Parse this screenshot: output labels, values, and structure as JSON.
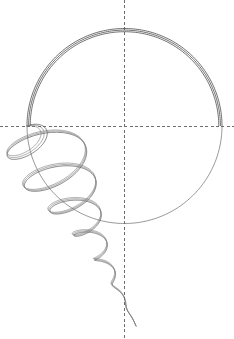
{
  "figure": {
    "width": 234,
    "height": 339,
    "background_color": "#ffffff",
    "line_color": "#555555",
    "axis_color": "#6e6e6e"
  },
  "chart_data": {
    "type": "line",
    "subtitle": "",
    "xlabel": "",
    "ylabel": "",
    "grid": false,
    "legend": "none",
    "axis_style": "dashed crosshair",
    "xlim": [
      0,
      234
    ],
    "ylim": [
      0,
      339
    ],
    "annotations": [],
    "tick_labels": {
      "x": [],
      "y": []
    },
    "center": {
      "x": 124.5,
      "y": 126
    },
    "circle": {
      "center_x": 124.5,
      "center_y": 126,
      "radius": 97.5,
      "left_point": {
        "x": 27,
        "y": 126
      },
      "right_point": {
        "x": 222,
        "y": 126
      },
      "top_point": {
        "x": 124.5,
        "y": 28.5
      },
      "bottom_point": {
        "x": 124.5,
        "y": 223.5
      },
      "overlapping_arc_count": 3,
      "arc_offsets": [
        0,
        1.6,
        3.2
      ],
      "heavy_arc_span_deg": [
        180,
        360
      ],
      "thin_arc_span_deg": [
        0,
        180
      ]
    },
    "axes": [
      {
        "name": "horizontal-axis",
        "orientation": "horizontal",
        "y": 126,
        "x_start": 0,
        "x_end": 234,
        "dash": "3 2.4"
      },
      {
        "name": "vertical-axis",
        "orientation": "vertical",
        "x": 124.5,
        "y_start": 0,
        "y_end": 339,
        "dash": "3 2.4"
      }
    ],
    "spiral": {
      "description": "damped oscillating spiral emanating from circle left point, converging to vertical axis at bottom",
      "origin": {
        "x": 27,
        "y": 126
      },
      "terminus": {
        "x": 122,
        "y": 326
      },
      "turn_count": 7,
      "decay": 0.72,
      "strand_count": 3,
      "strand_phase_offsets_deg": [
        0,
        14,
        28
      ],
      "lobe_extrema": [
        {
          "x": 30,
          "y": 132,
          "r": 4
        },
        {
          "x": 40,
          "y": 168,
          "r": 26
        },
        {
          "x": 69,
          "y": 160,
          "r": 40
        },
        {
          "x": 35,
          "y": 200,
          "r": 52
        },
        {
          "x": 98,
          "y": 190,
          "r": 62
        },
        {
          "x": 58,
          "y": 232,
          "r": 58
        },
        {
          "x": 128,
          "y": 216,
          "r": 52
        },
        {
          "x": 82,
          "y": 248,
          "r": 48
        },
        {
          "x": 150,
          "y": 236,
          "r": 40
        },
        {
          "x": 96,
          "y": 264,
          "r": 34
        },
        {
          "x": 158,
          "y": 256,
          "r": 30
        },
        {
          "x": 104,
          "y": 282,
          "r": 24
        },
        {
          "x": 152,
          "y": 276,
          "r": 20
        },
        {
          "x": 108,
          "y": 298,
          "r": 16
        },
        {
          "x": 142,
          "y": 294,
          "r": 13
        },
        {
          "x": 112,
          "y": 310,
          "r": 10
        },
        {
          "x": 134,
          "y": 308,
          "r": 8
        },
        {
          "x": 116,
          "y": 320,
          "r": 5
        },
        {
          "x": 122,
          "y": 326,
          "r": 2
        }
      ]
    }
  }
}
